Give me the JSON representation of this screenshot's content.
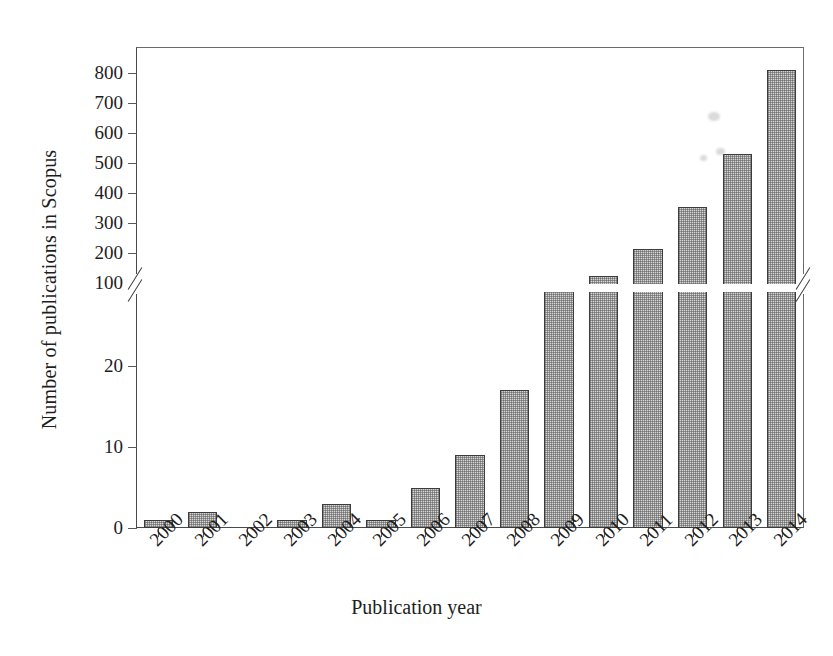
{
  "chart_data": {
    "type": "bar",
    "title": "",
    "xlabel": "Publication year",
    "ylabel": "Number of publications in Scopus",
    "categories": [
      "2000",
      "2001",
      "2002",
      "2003",
      "2004",
      "2005",
      "2006",
      "2007",
      "2008",
      "2009",
      "2010",
      "2011",
      "2012",
      "2013",
      "2014"
    ],
    "values": [
      1,
      2,
      0,
      1,
      3,
      1,
      5,
      9,
      17,
      90,
      125,
      215,
      352,
      530,
      810
    ],
    "series": [
      {
        "name": "Publications in Scopus",
        "values": [
          1,
          2,
          0,
          1,
          3,
          1,
          5,
          9,
          17,
          90,
          125,
          215,
          352,
          530,
          810
        ]
      }
    ],
    "y_ticks_lower": [
      "0",
      "10",
      "20"
    ],
    "y_ticks_upper": [
      "100",
      "200",
      "300",
      "400",
      "500",
      "600",
      "700",
      "800"
    ],
    "y_tick_values_lower": [
      0,
      10,
      20
    ],
    "y_tick_values_upper": [
      100,
      200,
      300,
      400,
      500,
      600,
      700,
      800
    ],
    "ylim": [
      0,
      860
    ],
    "axis_break": true,
    "axis_break_between": [
      20,
      100
    ],
    "grid": false,
    "legend": "none",
    "bar_fill_color": "#d6d6d6",
    "bar_edge_color": "#3c3c3c",
    "axis_color": "#4a4a4a",
    "background_color": "#ffffff"
  },
  "axis": {
    "y_title": "Number of publications in Scopus",
    "x_title": "Publication year"
  }
}
